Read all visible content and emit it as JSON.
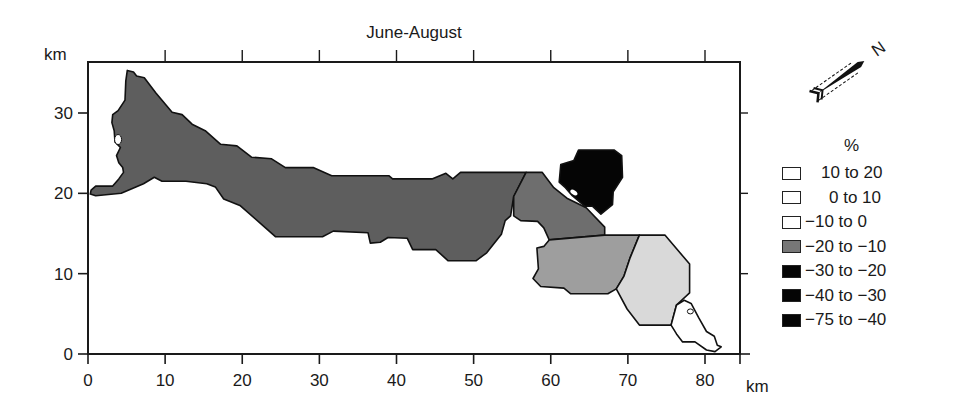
{
  "chart_data": {
    "type": "map",
    "title": "June-August",
    "x_axis": {
      "label": "km",
      "ticks": [
        0,
        10,
        20,
        30,
        40,
        50,
        60,
        70,
        80
      ],
      "range": [
        0,
        84
      ]
    },
    "y_axis": {
      "label": "km",
      "ticks": [
        0,
        10,
        20,
        30
      ],
      "range": [
        0,
        35.5
      ]
    },
    "north_arrow": {
      "label": "N"
    },
    "legend": {
      "title": "%",
      "items": [
        {
          "label": "10 to 20",
          "label_indent": true,
          "color": "#ffffff"
        },
        {
          "label": "0 to 10",
          "label_indent": true,
          "color": "#ffffff"
        },
        {
          "label": "−10 to 0",
          "label_indent": false,
          "color": "#ffffff"
        },
        {
          "label": "−20 to −10",
          "label_indent": false,
          "color": "#777777"
        },
        {
          "label": "−30 to −20",
          "label_indent": false,
          "color": "#050505"
        },
        {
          "label": "−40 to −30",
          "label_indent": false,
          "color": "#050505"
        },
        {
          "label": "−75 to −40",
          "label_indent": false,
          "color": "#050505"
        }
      ]
    },
    "regions": [
      {
        "name": "western-main-region",
        "class": "−20 to −10",
        "fill": "#5e5e5e"
      },
      {
        "name": "central-east-region",
        "class": "−20 to −10",
        "fill": "#6e6e6e"
      },
      {
        "name": "northeast-dark-region",
        "class": "−75 to −40",
        "fill": "#050505"
      },
      {
        "name": "south-mid-region",
        "class": "−20 to −10",
        "fill": "#9e9e9e"
      },
      {
        "name": "southeast-light-region",
        "class": "−10 to 0",
        "fill": "#d9d9d9"
      },
      {
        "name": "southeast-tip-region",
        "class": "0 to 10",
        "fill": "#ffffff"
      }
    ]
  }
}
